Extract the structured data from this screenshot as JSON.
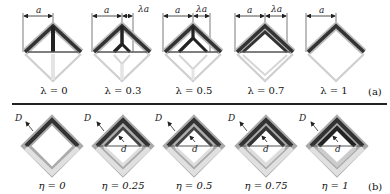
{
  "panel_a": {
    "tag": "(a)",
    "dimension_label_a": "a",
    "dimension_label_lambda_a": "λa",
    "cells": [
      {
        "label": "λ = 0",
        "lambda": 0
      },
      {
        "label": "λ = 0.3",
        "lambda": 0.3
      },
      {
        "label": "λ = 0.5",
        "lambda": 0.5
      },
      {
        "label": "λ = 0.7",
        "lambda": 0.7
      },
      {
        "label": "λ = 1",
        "lambda": 1
      }
    ]
  },
  "panel_b": {
    "tag": "(b)",
    "outer_label": "D",
    "inner_label": "d",
    "cells": [
      {
        "label": "η = 0",
        "eta": 0
      },
      {
        "label": "η = 0.25",
        "eta": 0.25
      },
      {
        "label": "η = 0.5",
        "eta": 0.5
      },
      {
        "label": "η = 0.75",
        "eta": 0.75
      },
      {
        "label": "η = 1",
        "eta": 1
      }
    ]
  },
  "colors": {
    "dark_strut": "#2a2a2a",
    "light_strut": "#d8d8d8",
    "dimension_line": "#222222",
    "divider": "#222222"
  }
}
